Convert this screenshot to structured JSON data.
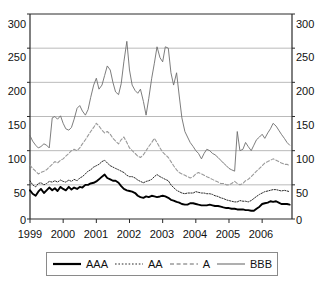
{
  "chart_data": {
    "type": "line",
    "title": "",
    "xlabel": "",
    "ylabel": "",
    "xlim": [
      1999,
      2006.9
    ],
    "ylim": [
      0,
      300
    ],
    "ytick_values": [
      0,
      50,
      100,
      150,
      200,
      250,
      300
    ],
    "ytick_labels": [
      "0",
      "50",
      "100",
      "150",
      "200",
      "250",
      "300"
    ],
    "xtick_values": [
      1999,
      2000,
      2001,
      2002,
      2003,
      2004,
      2005,
      2006
    ],
    "xtick_labels": [
      "1999",
      "2000",
      "2001",
      "2002",
      "2003",
      "2004",
      "2005",
      "2006"
    ],
    "grid": "horizontal",
    "legend_position": "bottom",
    "dual_y_axis": true,
    "x": [
      1999.0,
      1999.08,
      1999.17,
      1999.25,
      1999.33,
      1999.42,
      1999.5,
      1999.58,
      1999.67,
      1999.75,
      1999.83,
      1999.92,
      2000.0,
      2000.08,
      2000.17,
      2000.25,
      2000.33,
      2000.42,
      2000.5,
      2000.58,
      2000.67,
      2000.75,
      2000.83,
      2000.92,
      2001.0,
      2001.08,
      2001.17,
      2001.25,
      2001.33,
      2001.42,
      2001.5,
      2001.58,
      2001.67,
      2001.75,
      2001.83,
      2001.92,
      2002.0,
      2002.08,
      2002.17,
      2002.25,
      2002.33,
      2002.42,
      2002.5,
      2002.58,
      2002.67,
      2002.75,
      2002.83,
      2002.92,
      2003.0,
      2003.08,
      2003.17,
      2003.25,
      2003.33,
      2003.42,
      2003.5,
      2003.58,
      2003.67,
      2003.75,
      2003.83,
      2003.92,
      2004.0,
      2004.08,
      2004.17,
      2004.25,
      2004.33,
      2004.42,
      2004.5,
      2004.58,
      2004.67,
      2004.75,
      2004.83,
      2004.92,
      2005.0,
      2005.08,
      2005.17,
      2005.25,
      2005.33,
      2005.42,
      2005.5,
      2005.58,
      2005.67,
      2005.75,
      2005.83,
      2005.92,
      2006.0,
      2006.08,
      2006.17,
      2006.25,
      2006.33,
      2006.42,
      2006.5,
      2006.58,
      2006.67,
      2006.75,
      2006.83
    ],
    "series": [
      {
        "name": "AAA",
        "style": "solid-thick-black",
        "color": "#000000",
        "values": [
          42,
          37,
          34,
          40,
          44,
          38,
          42,
          46,
          42,
          45,
          41,
          47,
          44,
          42,
          47,
          43,
          46,
          44,
          47,
          46,
          50,
          50,
          52,
          53,
          55,
          58,
          62,
          65,
          60,
          58,
          56,
          56,
          53,
          48,
          44,
          42,
          41,
          40,
          38,
          34,
          32,
          31,
          33,
          32,
          34,
          33,
          32,
          33,
          34,
          33,
          31,
          28,
          27,
          25,
          24,
          22,
          21,
          21,
          23,
          23,
          22,
          21,
          20,
          20,
          20,
          21,
          20,
          19,
          19,
          18,
          17,
          16,
          16,
          15,
          15,
          14,
          14,
          14,
          13,
          13,
          12,
          12,
          15,
          18,
          22,
          23,
          24,
          26,
          25,
          26,
          24,
          22,
          22,
          22,
          21
        ]
      },
      {
        "name": "AA",
        "style": "dotted-fine-black",
        "color": "#2b2b2b",
        "values": [
          56,
          50,
          47,
          52,
          53,
          50,
          52,
          55,
          54,
          56,
          54,
          57,
          55,
          54,
          57,
          55,
          58,
          56,
          60,
          62,
          66,
          70,
          72,
          76,
          78,
          80,
          84,
          86,
          82,
          78,
          76,
          74,
          72,
          70,
          68,
          64,
          62,
          62,
          60,
          57,
          55,
          53,
          55,
          56,
          58,
          62,
          65,
          62,
          60,
          58,
          56,
          50,
          46,
          42,
          40,
          38,
          37,
          38,
          38,
          38,
          40,
          39,
          38,
          38,
          37,
          37,
          36,
          34,
          33,
          31,
          30,
          28,
          27,
          26,
          25,
          25,
          27,
          26,
          26,
          25,
          27,
          30,
          33,
          36,
          38,
          40,
          41,
          42,
          43,
          43,
          42,
          41,
          42,
          41,
          40
        ]
      },
      {
        "name": "A",
        "style": "dashed-gray",
        "color": "#9a9a9a",
        "values": [
          79,
          74,
          70,
          66,
          68,
          70,
          72,
          76,
          80,
          84,
          82,
          86,
          88,
          92,
          96,
          100,
          102,
          100,
          104,
          110,
          116,
          122,
          128,
          134,
          140,
          136,
          130,
          126,
          128,
          124,
          118,
          114,
          110,
          116,
          120,
          112,
          104,
          100,
          96,
          92,
          90,
          94,
          100,
          106,
          112,
          118,
          112,
          104,
          98,
          94,
          90,
          84,
          78,
          72,
          68,
          66,
          64,
          62,
          60,
          62,
          66,
          68,
          66,
          64,
          62,
          60,
          58,
          56,
          54,
          52,
          52,
          50,
          50,
          52,
          55,
          52,
          50,
          52,
          56,
          58,
          62,
          66,
          70,
          74,
          78,
          82,
          84,
          86,
          88,
          86,
          84,
          82,
          80,
          80,
          78
        ]
      },
      {
        "name": "BBB",
        "style": "solid-thin-gray",
        "color": "#6e6e6e",
        "values": [
          122,
          114,
          108,
          104,
          106,
          110,
          108,
          104,
          148,
          150,
          146,
          151,
          140,
          132,
          130,
          134,
          146,
          162,
          166,
          158,
          152,
          160,
          178,
          196,
          206,
          190,
          196,
          210,
          224,
          218,
          200,
          186,
          182,
          198,
          230,
          260,
          218,
          196,
          188,
          184,
          190,
          172,
          152,
          176,
          206,
          228,
          252,
          236,
          230,
          252,
          250,
          214,
          196,
          214,
          180,
          148,
          128,
          120,
          112,
          106,
          100,
          96,
          88,
          96,
          102,
          100,
          96,
          94,
          90,
          86,
          82,
          78,
          74,
          72,
          70,
          128,
          100,
          102,
          112,
          106,
          100,
          108,
          116,
          120,
          124,
          118,
          126,
          132,
          140,
          136,
          130,
          124,
          118,
          112,
          108
        ]
      }
    ],
    "legend": [
      {
        "label": "AAA",
        "style": "solid-thick-black",
        "color": "#000000"
      },
      {
        "label": "AA",
        "style": "dotted-fine-black",
        "color": "#2b2b2b"
      },
      {
        "label": "A",
        "style": "dashed-gray",
        "color": "#9a9a9a"
      },
      {
        "label": "BBB",
        "style": "solid-thin-gray",
        "color": "#6e6e6e"
      }
    ]
  }
}
